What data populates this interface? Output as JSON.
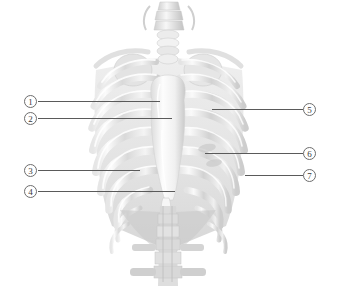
{
  "figure": {
    "background_color": "#ffffff",
    "line_color": "#5a5a5a",
    "marker_border_color": "#6d6d6d",
    "bone_light": "#f2f2f2",
    "bone_mid": "#d8d8d8",
    "bone_shadow": "#bdbdbd",
    "width": 337,
    "height": 292
  },
  "callouts": [
    {
      "number": "1",
      "marker_x": 24,
      "marker_y": 95,
      "line_x": 38,
      "line_y": 101,
      "line_w": 122,
      "side": "left"
    },
    {
      "number": "2",
      "marker_x": 24,
      "marker_y": 112,
      "line_x": 38,
      "line_y": 118,
      "line_w": 134,
      "side": "left"
    },
    {
      "number": "3",
      "marker_x": 24,
      "marker_y": 164,
      "line_x": 38,
      "line_y": 170,
      "line_w": 102,
      "side": "left"
    },
    {
      "number": "4",
      "marker_x": 24,
      "marker_y": 185,
      "line_x": 38,
      "line_y": 191,
      "line_w": 137,
      "side": "left"
    },
    {
      "number": "5",
      "marker_x": 303,
      "marker_y": 103,
      "line_x": 212,
      "line_y": 109,
      "line_w": 91,
      "side": "right"
    },
    {
      "number": "6",
      "marker_x": 303,
      "marker_y": 147,
      "line_x": 205,
      "line_y": 153,
      "line_w": 98,
      "side": "right"
    },
    {
      "number": "7",
      "marker_x": 303,
      "marker_y": 169,
      "line_x": 245,
      "line_y": 175,
      "line_w": 58,
      "side": "right"
    }
  ],
  "structures": {
    "cervical_spine": "cervical-vertebrae",
    "sternum": "sternum",
    "xiphoid": "xiphoid-process",
    "clavicle_left": "clavicle-left",
    "clavicle_right": "clavicle-right",
    "ribs": "rib-pairs",
    "lumbar_spine": "lumbar-vertebrae"
  }
}
